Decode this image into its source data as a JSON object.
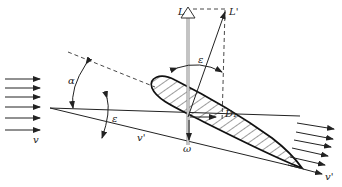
{
  "diagram": {
    "labels": {
      "lift": "L",
      "lift_prime": "L'",
      "epsilon_top": "ε",
      "alpha": "α",
      "epsilon_left": "ε",
      "v": "v",
      "v_prime": "v'",
      "d1": "D₁",
      "omega": "ω",
      "v_prime_right": "v'"
    },
    "colors": {
      "ink": "#222222",
      "lift_arrow": "#888888"
    }
  }
}
